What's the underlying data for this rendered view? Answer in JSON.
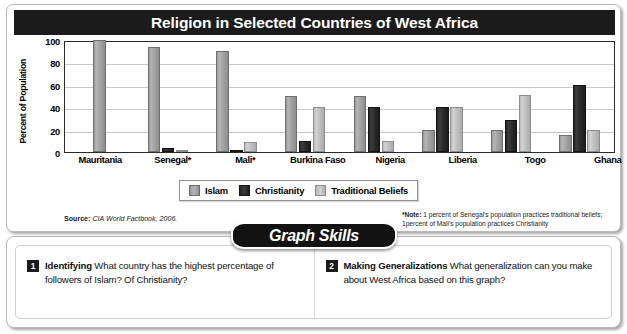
{
  "figure": {
    "title": "Religion in Selected Countries of West Africa",
    "source_label": "Source:",
    "source_text": "CIA World Factbook, 2006.",
    "note_label": "*Note:",
    "note_text": " 1 percent of Senegal's population practices traditional beliefs; 1percent of Mali's population practices Christianity"
  },
  "chart_data": {
    "type": "bar",
    "title": "Religion in Selected Countries of West Africa",
    "xlabel": "",
    "ylabel": "Percent of Population",
    "ylim": [
      0,
      100
    ],
    "yticks": [
      0,
      20,
      40,
      60,
      80,
      100
    ],
    "grid": true,
    "legend_position": "bottom",
    "categories": [
      "Mauritania",
      "Senegal*",
      "Mali*",
      "Burkina Faso",
      "Nigeria",
      "Liberia",
      "Togo",
      "Ghana"
    ],
    "series": [
      {
        "name": "Islam",
        "color": "#a0a0a0",
        "values": [
          100,
          94,
          90,
          50,
          50,
          20,
          20,
          15
        ]
      },
      {
        "name": "Christianity",
        "color": "#2a2a2a",
        "values": [
          0,
          4,
          1,
          10,
          40,
          40,
          29,
          60
        ]
      },
      {
        "name": "Traditional Beliefs",
        "color": "#c4c4c4",
        "values": [
          0,
          1,
          9,
          40,
          10,
          40,
          51,
          20
        ]
      }
    ]
  },
  "skills": {
    "banner": "Graph Skills",
    "questions": [
      {
        "number": "1",
        "heading": "Identifying",
        "body": " What country has the highest percentage of followers of Islam? Of Christianity?"
      },
      {
        "number": "2",
        "heading": "Making Generalizations",
        "body": " What generalization can you make about West Africa based on this graph?"
      }
    ]
  }
}
